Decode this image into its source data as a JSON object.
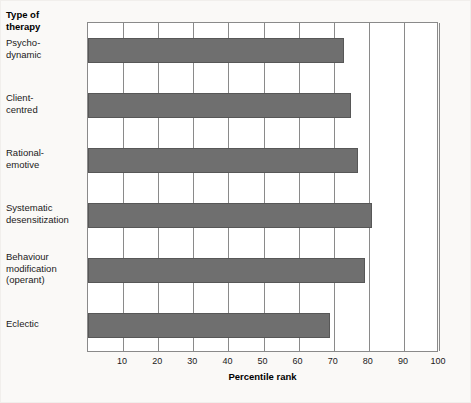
{
  "figure": {
    "category_axis_title": "Type of\ntherapy",
    "background_color": "#faf9f7",
    "plot_background_color": "#ffffff",
    "bar_color": "#6f6f6f",
    "bar_border_color": "#575757",
    "axis_color": "#8a8a8a"
  },
  "chart_data": {
    "type": "bar",
    "orientation": "horizontal",
    "title": "",
    "xlabel": "Percentile rank",
    "ylabel": "Type of therapy",
    "categories": [
      "Psycho-\ndynamic",
      "Client-\ncentred",
      "Rational-\nemotive",
      "Systematic\ndesensitization",
      "Behaviour\nmodification\n(operant)",
      "Eclectic"
    ],
    "values": [
      73,
      75,
      77,
      81,
      79,
      69
    ],
    "xlim": [
      0,
      100
    ],
    "xticks": [
      10,
      20,
      30,
      40,
      50,
      60,
      70,
      80,
      90,
      100
    ],
    "xticklabels": [
      "10",
      "20",
      "30",
      "40",
      "50",
      "60",
      "70",
      "80",
      "90",
      "100"
    ],
    "grid": "vertical",
    "legend": "none"
  }
}
